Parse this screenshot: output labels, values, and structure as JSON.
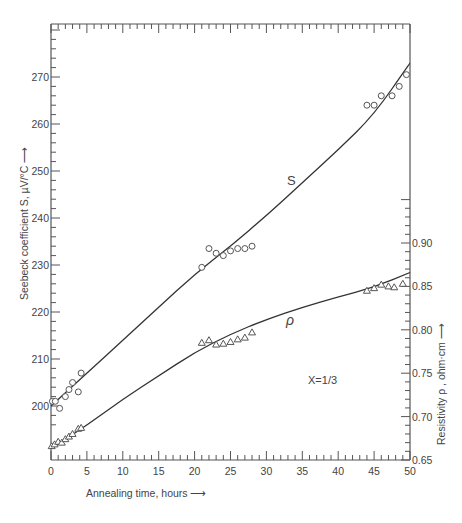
{
  "chart_data": {
    "type": "scatter",
    "title": "",
    "annotation": "X=1/3",
    "xlabel": "Annealing time, hours",
    "ylabel_left": "Seebeck coefficient S, µV/°C",
    "ylabel_right": "Resistivity ρ , ohm·cm",
    "xlim": [
      0,
      50
    ],
    "ylim_left": [
      193,
      287
    ],
    "ylim_right": [
      0.65,
      0.95
    ],
    "x_ticks": [
      0,
      5,
      10,
      15,
      20,
      25,
      30,
      35,
      40,
      45,
      50
    ],
    "y_ticks_left": [
      200,
      210,
      220,
      230,
      240,
      250,
      260,
      270
    ],
    "y_ticks_right": [
      0.65,
      0.7,
      0.75,
      0.8,
      0.85,
      0.9
    ],
    "grid": false,
    "series": [
      {
        "name": "S",
        "axis": "left",
        "marker": "circle",
        "points": [
          [
            0.2,
            201
          ],
          [
            0.6,
            201
          ],
          [
            1.2,
            199.5
          ],
          [
            2,
            202
          ],
          [
            2.5,
            203.5
          ],
          [
            3,
            205
          ],
          [
            3.8,
            203
          ],
          [
            4.2,
            207
          ],
          [
            21,
            229.5
          ],
          [
            22,
            233.5
          ],
          [
            23,
            232.5
          ],
          [
            24,
            232
          ],
          [
            25,
            233
          ],
          [
            26,
            233.5
          ],
          [
            27,
            233.5
          ],
          [
            28,
            234
          ],
          [
            44,
            264
          ],
          [
            45,
            264
          ],
          [
            46,
            266
          ],
          [
            47.5,
            266
          ],
          [
            48.5,
            268
          ],
          [
            49.5,
            270.5
          ]
        ],
        "curve": [
          [
            0,
            200
          ],
          [
            5,
            207
          ],
          [
            10,
            214
          ],
          [
            15,
            221
          ],
          [
            20,
            228
          ],
          [
            25,
            234
          ],
          [
            30,
            240.5
          ],
          [
            35,
            247.5
          ],
          [
            40,
            254.5
          ],
          [
            45,
            262
          ],
          [
            50,
            273
          ]
        ]
      },
      {
        "name": "ρ",
        "axis": "right",
        "marker": "triangle",
        "points": [
          [
            0.1,
            0.666
          ],
          [
            0.5,
            0.668
          ],
          [
            1,
            0.671
          ],
          [
            1.5,
            0.67
          ],
          [
            2,
            0.674
          ],
          [
            2.5,
            0.677
          ],
          [
            3,
            0.68
          ],
          [
            3.8,
            0.686
          ],
          [
            4.2,
            0.687
          ],
          [
            21,
            0.785
          ],
          [
            22,
            0.788
          ],
          [
            23,
            0.783
          ],
          [
            24,
            0.784
          ],
          [
            25,
            0.786
          ],
          [
            26,
            0.789
          ],
          [
            27,
            0.791
          ],
          [
            28,
            0.797
          ],
          [
            44,
            0.845
          ],
          [
            45,
            0.848
          ],
          [
            46,
            0.852
          ],
          [
            47,
            0.85
          ],
          [
            47.8,
            0.849
          ],
          [
            49,
            0.853
          ]
        ],
        "curve": [
          [
            0,
            0.663
          ],
          [
            5,
            0.69
          ],
          [
            10,
            0.72
          ],
          [
            15,
            0.747
          ],
          [
            20,
            0.774
          ],
          [
            25,
            0.795
          ],
          [
            30,
            0.812
          ],
          [
            35,
            0.826
          ],
          [
            40,
            0.838
          ],
          [
            45,
            0.849
          ],
          [
            50,
            0.866
          ]
        ]
      }
    ]
  },
  "labels": {
    "s_curve": "S",
    "rho_curve": "ρ"
  }
}
